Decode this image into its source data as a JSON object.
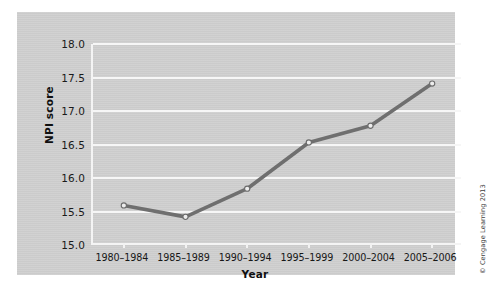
{
  "chart_data": {
    "type": "line",
    "title": "",
    "subtitle": "",
    "xlabel": "Year",
    "ylabel": "NPI score",
    "categories": [
      "1980–1984",
      "1985–1989",
      "1990–1994",
      "1995–1999",
      "2000–2004",
      "2005–2006"
    ],
    "values": [
      15.59,
      15.42,
      15.84,
      16.53,
      16.78,
      17.41
    ],
    "series": [
      {
        "name": "NPI score",
        "values": [
          15.59,
          15.42,
          15.84,
          16.53,
          16.78,
          17.41
        ]
      }
    ],
    "ylim": [
      15.0,
      18.0
    ],
    "ytick_labels": [
      "18.0",
      "17.5",
      "17.0",
      "16.5",
      "16.0",
      "15.5",
      "15.0"
    ],
    "ytick_values": [
      18.0,
      17.5,
      17.0,
      16.5,
      16.0,
      15.5,
      15.0
    ],
    "grid": true,
    "grid_orientation": "horizontal",
    "legend": "none",
    "marker": "open-circle",
    "line_color": "#6f6f6f",
    "marker_fill": "#ededed",
    "marker_edge": "#6b6b6b",
    "gridline_color": "#f6f6f6",
    "panel_background": "#cfcfcf"
  },
  "credit": {
    "text": "© Cengage Learning 2013"
  }
}
